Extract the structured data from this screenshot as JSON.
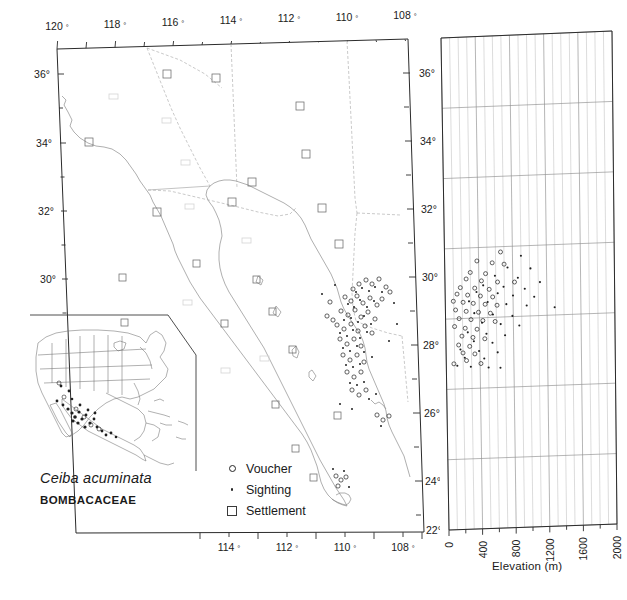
{
  "figure": {
    "species_name": "Ceiba acuminata",
    "family_name": "BOMBACACEAE",
    "type": "species-distribution-map"
  },
  "main_map": {
    "name": "distribution-map",
    "region": "Northwest Mexico and Southwest United States",
    "top_axis": {
      "labels": [
        "120 °",
        "118 °",
        "116 °",
        "114 °",
        "112 °",
        "110 °",
        "108 °"
      ],
      "values": [
        120,
        118,
        116,
        114,
        112,
        110,
        108
      ],
      "unit": "degrees west longitude"
    },
    "bottom_axis": {
      "labels": [
        "114 °",
        "112 °",
        "110 °",
        "108 °"
      ],
      "values": [
        114,
        112,
        110,
        108
      ],
      "unit": "degrees west longitude"
    },
    "left_axis": {
      "labels": [
        "36°",
        "34°",
        "32°",
        "30°"
      ],
      "values": [
        36,
        34,
        32,
        30
      ],
      "unit": "degrees north latitude"
    },
    "right_axis": {
      "labels": [
        "36°",
        "34°",
        "32°",
        "30°",
        "28°",
        "26°",
        "24°",
        "22°"
      ],
      "values": [
        36,
        34,
        32,
        30,
        28,
        26,
        24,
        22
      ],
      "unit": "degrees north latitude"
    }
  },
  "legend": {
    "name": "map-legend",
    "items": [
      {
        "symbol": "open-circle",
        "label": "Voucher"
      },
      {
        "symbol": "small-dot",
        "label": "Sighting"
      },
      {
        "symbol": "open-square",
        "label": "Settlement"
      }
    ]
  },
  "inset_map": {
    "name": "north-america-inset",
    "region": "North America",
    "description": "Continental range inset showing occurrences in western and southern Mexico"
  },
  "chart_data": {
    "type": "scatter",
    "title": "",
    "xlabel": "Elevation (m)",
    "ylabel": "",
    "xlim": [
      0,
      2000
    ],
    "ylim": [
      22,
      36
    ],
    "xticks": [
      0,
      400,
      800,
      1200,
      1600,
      2000
    ],
    "xticklabels": [
      "0",
      "400",
      "800",
      "1200",
      "1600",
      "2000"
    ],
    "yticks": [
      22,
      24,
      26,
      28,
      30,
      32,
      34,
      36
    ],
    "yticklabels": [
      "22°",
      "24°",
      "26°",
      "28°",
      "30°",
      "32°",
      "34°",
      "36°"
    ],
    "grid": true,
    "legend_position": "none",
    "series": [
      {
        "name": "Voucher",
        "marker": "open-circle",
        "points": [
          [
            660,
            29.85
          ],
          [
            380,
            29.62
          ],
          [
            560,
            29.55
          ],
          [
            700,
            29.5
          ],
          [
            300,
            29.3
          ],
          [
            480,
            29.25
          ],
          [
            250,
            29.12
          ],
          [
            430,
            29.05
          ],
          [
            620,
            29.0
          ],
          [
            820,
            28.98
          ],
          [
            180,
            28.88
          ],
          [
            350,
            28.85
          ],
          [
            520,
            28.8
          ],
          [
            140,
            28.7
          ],
          [
            265,
            28.66
          ],
          [
            415,
            28.62
          ],
          [
            560,
            28.58
          ],
          [
            95,
            28.5
          ],
          [
            210,
            28.46
          ],
          [
            330,
            28.42
          ],
          [
            470,
            28.38
          ],
          [
            610,
            28.34
          ],
          [
            120,
            28.25
          ],
          [
            245,
            28.2
          ],
          [
            390,
            28.16
          ],
          [
            530,
            28.12
          ],
          [
            160,
            28.0
          ],
          [
            300,
            27.96
          ],
          [
            440,
            27.92
          ],
          [
            585,
            27.88
          ],
          [
            105,
            27.78
          ],
          [
            230,
            27.72
          ],
          [
            370,
            27.68
          ],
          [
            190,
            27.5
          ],
          [
            320,
            27.45
          ],
          [
            460,
            27.4
          ],
          [
            150,
            27.25
          ],
          [
            280,
            27.2
          ],
          [
            200,
            27.02
          ],
          [
            340,
            26.98
          ],
          [
            240,
            26.8
          ],
          [
            90,
            26.72
          ],
          [
            410,
            26.7
          ]
        ]
      },
      {
        "name": "Sighting",
        "marker": "dot",
        "points": [
          [
            900,
            29.72
          ],
          [
            740,
            29.4
          ],
          [
            1010,
            29.35
          ],
          [
            590,
            29.18
          ],
          [
            860,
            29.1
          ],
          [
            1120,
            28.95
          ],
          [
            450,
            28.92
          ],
          [
            690,
            28.86
          ],
          [
            940,
            28.78
          ],
          [
            370,
            28.74
          ],
          [
            620,
            28.68
          ],
          [
            800,
            28.6
          ],
          [
            1050,
            28.54
          ],
          [
            280,
            28.48
          ],
          [
            500,
            28.44
          ],
          [
            720,
            28.36
          ],
          [
            960,
            28.3
          ],
          [
            1290,
            28.22
          ],
          [
            340,
            28.14
          ],
          [
            560,
            28.08
          ],
          [
            790,
            28.02
          ],
          [
            430,
            27.86
          ],
          [
            650,
            27.8
          ],
          [
            870,
            27.74
          ],
          [
            260,
            27.6
          ],
          [
            480,
            27.54
          ],
          [
            700,
            27.48
          ],
          [
            330,
            27.34
          ],
          [
            550,
            27.28
          ],
          [
            170,
            27.12
          ],
          [
            390,
            27.06
          ],
          [
            610,
            27.0
          ],
          [
            220,
            26.88
          ],
          [
            450,
            26.84
          ],
          [
            130,
            26.66
          ],
          [
            290,
            26.62
          ],
          [
            500,
            26.58
          ],
          [
            640,
            26.56
          ]
        ]
      }
    ]
  }
}
